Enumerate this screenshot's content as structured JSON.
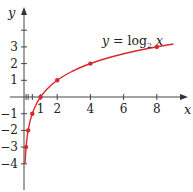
{
  "chart_data": {
    "type": "line",
    "title": "",
    "function_label": "y = log₂ x",
    "function_label_parts": {
      "lhs": "y",
      "eq": " = log",
      "base": "2",
      "var": " x"
    },
    "xlabel": "x",
    "ylabel": "y",
    "xlim": [
      -0.5,
      9.8
    ],
    "ylim": [
      -5.3,
      5.8
    ],
    "x_ticks": [
      1,
      2,
      4,
      6,
      8
    ],
    "x_tick_labels": [
      "1",
      "2",
      "4",
      "6",
      "8"
    ],
    "x_minor_ticks": [
      0.125,
      0.25,
      0.5,
      1,
      2,
      4,
      6,
      8
    ],
    "y_ticks": [
      -4,
      -3,
      -2,
      -1,
      1,
      2,
      3,
      4
    ],
    "y_tick_labels": [
      "−4",
      "−3",
      "−2",
      "−1",
      "1",
      "2",
      "3",
      ""
    ],
    "grid": false,
    "legend": "none",
    "series": [
      {
        "name": "y = log2 x",
        "color": "#d9282f",
        "marked_points": [
          {
            "x": 0.125,
            "y": -3
          },
          {
            "x": 0.25,
            "y": -2
          },
          {
            "x": 0.5,
            "y": -1
          },
          {
            "x": 1,
            "y": 0
          },
          {
            "x": 2,
            "y": 1
          },
          {
            "x": 4,
            "y": 2
          },
          {
            "x": 8,
            "y": 3
          }
        ],
        "domain": [
          0.0625,
          9.0
        ]
      }
    ]
  },
  "colors": {
    "curve": "#d9282f",
    "axis": "#444444",
    "text": "#222222"
  }
}
